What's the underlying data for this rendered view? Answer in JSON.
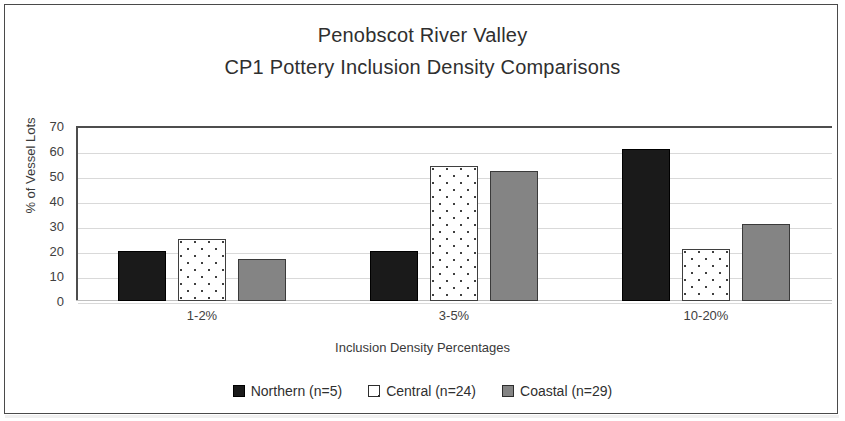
{
  "chart_data": {
    "type": "bar",
    "title": "Penobscot River Valley",
    "subtitle": "CP1 Pottery Inclusion Density Comparisons",
    "xlabel": "Inclusion Density Percentages",
    "ylabel": "% of Vessel Lots",
    "categories": [
      "1-2%",
      "3-5%",
      "10-20%"
    ],
    "series": [
      {
        "name": "Northern (n=5)",
        "values": [
          20,
          20,
          61
        ],
        "color": "#1a1a1a",
        "fill": "solid-black"
      },
      {
        "name": "Central (n=24)",
        "values": [
          25,
          54,
          21
        ],
        "color": "#ffffff",
        "fill": "white-dotted"
      },
      {
        "name": "Coastal (n=29)",
        "values": [
          17,
          52,
          31
        ],
        "color": "#848484",
        "fill": "solid-gray"
      }
    ],
    "ylim": [
      0,
      70
    ],
    "y_ticks": [
      70,
      60,
      50,
      40,
      30,
      20,
      10,
      0
    ],
    "grid": true,
    "legend_position": "bottom"
  },
  "figure": {
    "border_color": "#4a4a4a",
    "background": "#ffffff",
    "gridline_color": "#d9d9d9"
  }
}
